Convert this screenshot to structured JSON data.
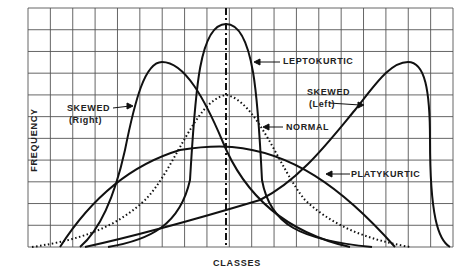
{
  "chart_data": {
    "type": "line",
    "title": "",
    "xlabel": "CLASSES",
    "ylabel": "FREQUENCY",
    "grid": true,
    "legend_position": "inline annotations with arrows",
    "x_ticks": [],
    "y_ticks": [],
    "grid_columns": 19,
    "grid_rows": 11,
    "center_line": {
      "style": "dash-dot",
      "x_class": 9
    },
    "series": [
      {
        "name": "SKEWED (Right)",
        "style": "solid",
        "shape": "right-skewed",
        "peak_class": 6,
        "peak_rel_height": 0.78
      },
      {
        "name": "LEPTOKURTIC",
        "style": "solid",
        "shape": "tall narrow symmetric",
        "peak_class": 9,
        "peak_rel_height": 0.93
      },
      {
        "name": "NORMAL",
        "style": "dotted",
        "shape": "symmetric bell",
        "peak_class": 9,
        "peak_rel_height": 0.63
      },
      {
        "name": "PLATYKURTIC",
        "style": "solid",
        "shape": "flat wide symmetric",
        "peak_class": 9,
        "peak_rel_height": 0.42
      },
      {
        "name": "SKEWED (Left)",
        "style": "solid",
        "shape": "left-skewed",
        "peak_class": 17,
        "peak_rel_height": 0.78
      }
    ]
  },
  "labels": {
    "ylabel": "FREQUENCY",
    "xlabel": "CLASSES",
    "skewed_right_1": "SKEWED",
    "skewed_right_2": "(Right)",
    "leptokurtic": "LEPTOKURTIC",
    "normal": "NORMAL",
    "skewed_left_1": "SKEWED",
    "skewed_left_2": "(Left)",
    "platykurtic": "PLATYKURTIC"
  },
  "colors": {
    "ink": "#111111",
    "grid": "#444444",
    "background": "#ffffff"
  }
}
